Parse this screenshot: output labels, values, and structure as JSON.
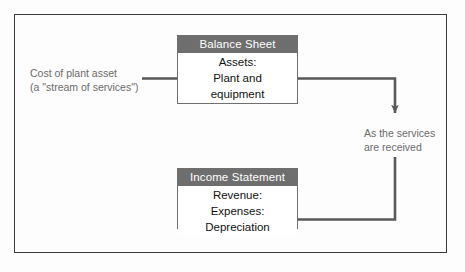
{
  "diagram": {
    "frame": {
      "border_color": "#3a3a3a"
    },
    "palette": {
      "header_gray": "#6e6e6e",
      "connector_gray": "#595959",
      "label_gray": "#6b6b6b",
      "box_border": "#6f6f6f",
      "background": "#fdfdfd"
    },
    "boxes": [
      {
        "id": "balance-sheet",
        "header": "Balance Sheet",
        "rows": [
          "Assets:",
          "Plant and",
          "equipment"
        ]
      },
      {
        "id": "income-statement",
        "header": "Income Statement",
        "rows": [
          "Revenue:",
          "Expenses:",
          "Depreciation"
        ]
      }
    ],
    "labels": {
      "cost_line1": "Cost of plant asset",
      "cost_line2": "(a \"stream of services\")",
      "services_line1": "As the services",
      "services_line2": "are received"
    },
    "connectors": [
      {
        "name": "cost-to-plant-asset-arrow",
        "from": "Cost of plant asset label",
        "to": "Plant and equipment row",
        "direction": "right"
      },
      {
        "name": "plant-asset-to-depreciation-arrow",
        "from": "Plant and equipment row",
        "to": "Depreciation row",
        "direction": "right-down-left",
        "midpoint_annotation": "As the services are received"
      }
    ]
  }
}
